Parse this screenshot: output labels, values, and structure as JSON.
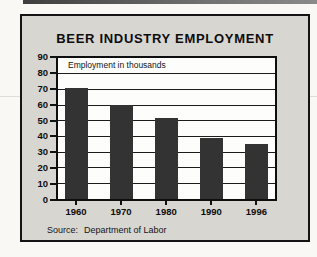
{
  "colors": {
    "bar": "#333333",
    "frame_background": "#d8d6d1",
    "plot_background": "#fdfdfb",
    "top_rule": "#4a4a4a",
    "text": "#0d0d0d"
  },
  "chart_data": {
    "type": "bar",
    "title": "BEER INDUSTRY EMPLOYMENT",
    "annotation": "Employment in thousands",
    "source_label": "Source:",
    "source_value": "Department of Labor",
    "categories": [
      "1960",
      "1970",
      "1980",
      "1990",
      "1996"
    ],
    "values": [
      71,
      60,
      52,
      39,
      35
    ],
    "xlabel": "",
    "ylabel": "Employment in thousands",
    "ylim": [
      0,
      90
    ],
    "ytick_step": 10,
    "yticks": [
      0,
      10,
      20,
      30,
      40,
      50,
      60,
      70,
      80,
      90
    ],
    "grid": true,
    "legend_position": "none"
  }
}
